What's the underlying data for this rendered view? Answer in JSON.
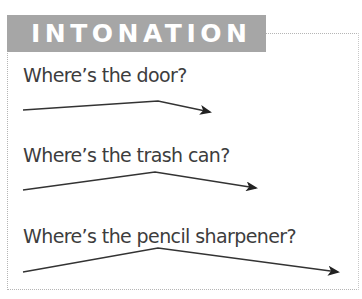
{
  "header": {
    "title": "INTONATION",
    "background_color": "#a6a6a6",
    "text_color": "#ffffff"
  },
  "items": [
    {
      "phrase": "Where’s the door?",
      "intonation": "rise-fall",
      "arrow": {
        "start": [
          23,
          110
        ],
        "peak": [
          158,
          101
        ],
        "end": [
          210,
          112
        ]
      }
    },
    {
      "phrase": "Where’s the trash can?",
      "intonation": "rise-fall",
      "arrow": {
        "start": [
          23,
          190
        ],
        "peak": [
          155,
          172
        ],
        "end": [
          256,
          188
        ]
      }
    },
    {
      "phrase": "Where’s the pencil sharpener?",
      "intonation": "rise-fall",
      "arrow": {
        "start": [
          23,
          272
        ],
        "peak": [
          158,
          248
        ],
        "end": [
          338,
          272
        ]
      }
    }
  ],
  "colors": {
    "text": "#3d3d3d",
    "arrow": "#222222",
    "border": "#b5b5b5"
  }
}
